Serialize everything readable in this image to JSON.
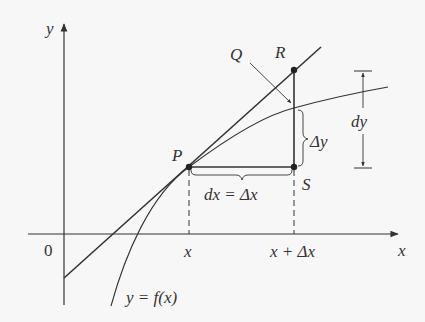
{
  "diagram": {
    "axes": {
      "x_label": "x",
      "y_label": "y",
      "origin_label": "0"
    },
    "points": {
      "P": "P",
      "Q": "Q",
      "R": "R",
      "S": "S"
    },
    "tick_labels": {
      "x": "x",
      "x_plus_dx": "x + Δx"
    },
    "annotations": {
      "dx": "dx = Δx",
      "delta_y": "Δy",
      "dy": "dy",
      "curve": "y = f(x)"
    },
    "colors": {
      "stroke": "#333333",
      "background": "#f7f7f7"
    }
  }
}
